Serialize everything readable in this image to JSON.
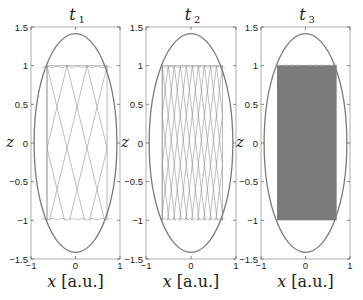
{
  "chart_data": [
    {
      "type": "line",
      "title": "t1",
      "title_base": "t",
      "title_sub": "1",
      "xlabel_var": "x",
      "xlabel_unit": "[a.u.]",
      "ylabel": "z",
      "xlim": [
        -1,
        1
      ],
      "ylim": [
        -1.5,
        1.5
      ],
      "xticks": [
        "-1",
        "0",
        "1"
      ],
      "yticks": [
        "1.5",
        "1",
        "0.5",
        "0",
        "-0.5",
        "-1",
        "-1.5"
      ],
      "ellipse": {
        "cx": 0,
        "cz": 0,
        "rx": 0.93,
        "rz": 1.414
      },
      "trajectory": {
        "x_range": [
          -0.64,
          0.71
        ],
        "z_range": [
          -1,
          1
        ],
        "density": "sparse",
        "n_crossings": 6
      }
    },
    {
      "type": "line",
      "title": "t2",
      "title_base": "t",
      "title_sub": "2",
      "xlabel_var": "x",
      "xlabel_unit": "[a.u.]",
      "ylabel": "z",
      "xlim": [
        -1,
        1
      ],
      "ylim": [
        -1.5,
        1.5
      ],
      "xticks": [
        "-1",
        "0",
        "1"
      ],
      "yticks": [
        "1.5",
        "1",
        "0.5",
        "0",
        "-0.5",
        "-1",
        "-1.5"
      ],
      "ellipse": {
        "cx": 0,
        "cz": 0,
        "rx": 0.93,
        "rz": 1.414
      },
      "trajectory": {
        "x_range": [
          -0.64,
          0.7
        ],
        "z_range": [
          -1,
          1
        ],
        "density": "dense",
        "n_crossings": 20
      }
    },
    {
      "type": "line",
      "title": "t3",
      "title_base": "t",
      "title_sub": "3",
      "xlabel_var": "x",
      "xlabel_unit": "[a.u.]",
      "ylabel": "z",
      "xlim": [
        -1,
        1
      ],
      "ylim": [
        -1.5,
        1.5
      ],
      "xticks": [
        "-1",
        "0",
        "1"
      ],
      "yticks": [
        "1.5",
        "1",
        "0.5",
        "0",
        "-0.5",
        "-1",
        "-1.5"
      ],
      "ellipse": {
        "cx": 0,
        "cz": 0,
        "rx": 0.93,
        "rz": 1.414
      },
      "trajectory": {
        "x_range": [
          -0.64,
          0.7
        ],
        "z_range": [
          -1,
          1
        ],
        "density": "filled",
        "n_crossings": 0
      }
    }
  ],
  "colors": {
    "ellipse": "#7a7a7a",
    "trajectory": "#8a8a8a",
    "fill": "#7b7b7b",
    "axes": "#9a9a9a"
  }
}
